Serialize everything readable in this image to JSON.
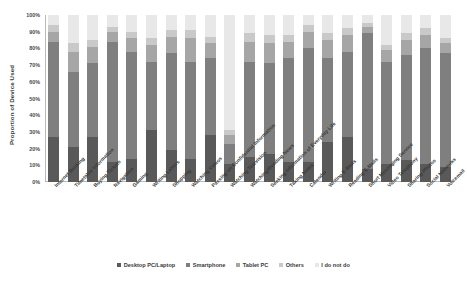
{
  "chart_data": {
    "type": "bar",
    "subtype": "stacked-percent",
    "title": "",
    "xlabel": "",
    "ylabel": "Proportion of Device Used",
    "ylim": [
      0,
      100
    ],
    "ytick_labels": [
      "100%",
      "90%",
      "80%",
      "70%",
      "60%",
      "50%",
      "40%",
      "30%",
      "20%",
      "10%",
      "0%"
    ],
    "grid": false,
    "legend_position": "bottom",
    "legend": [
      "Desktop PC/Laptop",
      "Smartphone",
      "Tablet PC",
      "Others",
      "I do not do"
    ],
    "colors": {
      "Desktop PC/Laptop": "#595959",
      "Smartphone": "#7f7f7f",
      "Tablet PC": "#a6a6a6",
      "Others": "#c9c9c9",
      "I do not do": "#e8e8e8"
    },
    "categories": [
      "Internet Banking",
      "Timetable Information",
      "Buying Tickets",
      "Navigation",
      "Gaming",
      "Writing Letters",
      "Shopping",
      "Watching Videos",
      "Passing on Confidential Information",
      "Watching Television",
      "Watching/Reading News",
      "Seeking Information of Everyday Life",
      "Taking Notes",
      "Calendar",
      "Writing E-Mails",
      "Reading E-Mails",
      "Short Messaging Service",
      "Video Telephony",
      "Sharing Photos",
      "Social Networks",
      "Voicemail"
    ],
    "series": [
      {
        "name": "Desktop PC/Laptop",
        "values": [
          27,
          21,
          27,
          12,
          14,
          31,
          19,
          14,
          28,
          11,
          15,
          17,
          12,
          12,
          24,
          27,
          8,
          11,
          13,
          11,
          9
        ]
      },
      {
        "name": "Smartphone",
        "values": [
          57,
          45,
          44,
          72,
          64,
          41,
          58,
          58,
          46,
          12,
          57,
          54,
          62,
          68,
          50,
          51,
          81,
          61,
          63,
          69,
          68
        ]
      },
      {
        "name": "Tablet PC",
        "values": [
          6,
          12,
          10,
          6,
          8,
          10,
          10,
          14,
          9,
          5,
          12,
          12,
          10,
          10,
          11,
          10,
          4,
          7,
          9,
          8,
          6
        ]
      },
      {
        "name": "Others",
        "values": [
          4,
          5,
          4,
          3,
          4,
          4,
          4,
          5,
          4,
          3,
          5,
          5,
          4,
          4,
          4,
          4,
          2,
          3,
          4,
          4,
          3
        ]
      },
      {
        "name": "I do not do",
        "values": [
          6,
          17,
          15,
          7,
          10,
          14,
          9,
          9,
          13,
          69,
          11,
          12,
          12,
          6,
          11,
          8,
          5,
          18,
          11,
          8,
          14
        ]
      }
    ]
  }
}
